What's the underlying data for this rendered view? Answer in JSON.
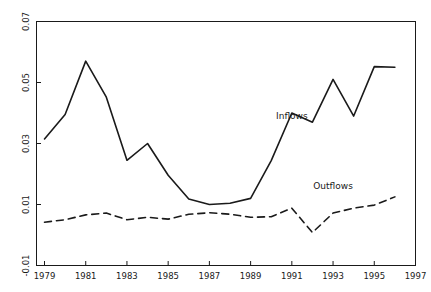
{
  "chart_data": {
    "type": "line",
    "title": "",
    "subtitle": "",
    "xlabel": "",
    "ylabel": "",
    "xlim": [
      1979,
      1997
    ],
    "ylim": [
      -0.01,
      0.07
    ],
    "grid": false,
    "legend_position": "inline-annotation",
    "x_ticks": [
      "1979",
      "1981",
      "1983",
      "1985",
      "1987",
      "1989",
      "1991",
      "1993",
      "1995",
      "1997"
    ],
    "x_tick_values": [
      1979,
      1981,
      1983,
      1985,
      1987,
      1989,
      1991,
      1993,
      1995,
      1997
    ],
    "y_ticks": [
      "0.07",
      "0.05",
      "0.03",
      "0.01",
      "-0.01"
    ],
    "y_tick_values": [
      0.07,
      0.05,
      0.03,
      0.01,
      -0.01
    ],
    "x": [
      1979,
      1980,
      1981,
      1982,
      1983,
      1984,
      1985,
      1986,
      1987,
      1988,
      1989,
      1990,
      1991,
      1992,
      1993,
      1994,
      1995,
      1996
    ],
    "series": [
      {
        "name": "Inflows",
        "style": "solid",
        "color": "#1a1a1a",
        "values": [
          0.0315,
          0.0395,
          0.057,
          0.0452,
          0.0245,
          0.03,
          0.0196,
          0.0118,
          0.01,
          0.0104,
          0.012,
          0.0244,
          0.04,
          0.037,
          0.051,
          0.039,
          0.0552,
          0.055
        ],
        "label_text": "Inflows",
        "label_x": 1991.0,
        "label_y": 0.038
      },
      {
        "name": "Outflows",
        "style": "dashed",
        "color": "#1a1a1a",
        "values": [
          0.0042,
          0.005,
          0.0066,
          0.0072,
          0.005,
          0.0058,
          0.0052,
          0.0068,
          0.0073,
          0.0068,
          0.0058,
          0.006,
          0.0088,
          0.0008,
          0.0072,
          0.0088,
          0.0098,
          0.0125
        ],
        "label_text": "Outflows",
        "label_x": 1993.0,
        "label_y": 0.0152
      }
    ]
  },
  "axes": {
    "frame_color": "#1a1a1a",
    "tick_color": "#1a1a1a"
  }
}
